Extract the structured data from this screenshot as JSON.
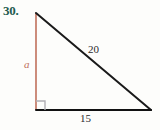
{
  "figure": {
    "problem_number": "30.",
    "type": "right-triangle-diagram",
    "labels": {
      "vertical_leg": "a",
      "hypotenuse": "20",
      "horizontal_leg": "15"
    },
    "colors": {
      "problem_number": "#1f5b4e",
      "vertical_leg": "#c0705c",
      "hypotenuse": "#1a1a1a",
      "horizontal_leg": "#111111",
      "right_angle_marker": "#b0aeb4",
      "background": "#fdfdfb"
    },
    "geometry": {
      "apex": [
        36,
        13
      ],
      "right_angle_vertex": [
        36,
        110
      ],
      "right_vertex": [
        151,
        110
      ],
      "right_angle_marker_size": 9
    }
  }
}
